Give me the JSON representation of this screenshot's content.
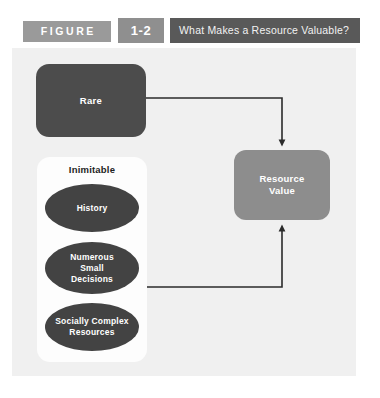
{
  "figure": {
    "band_label": "FIGURE",
    "number": "1-2",
    "title": "What Makes a Resource Valuable?"
  },
  "diagram": {
    "rare": {
      "label": "Rare"
    },
    "inimitable": {
      "label": "Inimitable",
      "factors": [
        {
          "label": "History"
        },
        {
          "label": "Numerous\nSmall\nDecisions",
          "line1": "Numerous",
          "line2": "Small",
          "line3": "Decisions"
        },
        {
          "label": "Socially Complex\nResources",
          "line1": "Socially Complex",
          "line2": "Resources"
        }
      ]
    },
    "resource_value": {
      "line1": "Resource",
      "line2": "Value"
    }
  },
  "colors": {
    "panel_background": "#f0f0f0",
    "card_background": "#fdfdfd",
    "dark_box": "#4c4c4c",
    "ellipse_fill": "#434343",
    "resource_box": "#8d8d8d",
    "band_gray": "#9a9a9a",
    "number_gray": "#8f8f8f",
    "title_dark": "#595959",
    "connector_line": "#2b2b2b"
  }
}
